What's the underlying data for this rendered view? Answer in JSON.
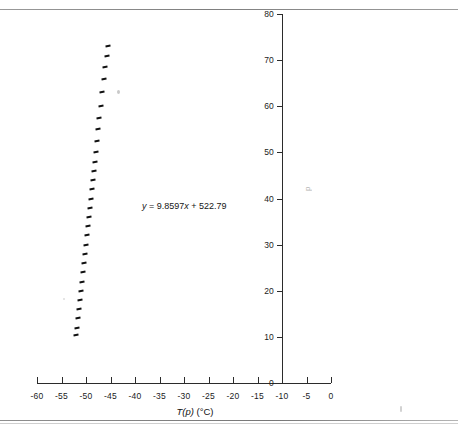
{
  "figure": {
    "equation_label": "y = 9.8597x + 522.79",
    "equation_slope": "9.8597",
    "equation_intercept": "522.79",
    "x_axis_title_main": "T(p)",
    "x_axis_title_units": "(°C)",
    "y_axis_title": "p"
  },
  "chart_data": {
    "type": "scatter",
    "title": "",
    "xlabel": "T(p) (°C)",
    "ylabel": "p",
    "xlim": [
      -60,
      0
    ],
    "ylim": [
      0,
      80
    ],
    "xticks": [
      -60,
      -55,
      -50,
      -45,
      -40,
      -35,
      -30,
      -25,
      -20,
      -15,
      -10,
      -5,
      0
    ],
    "xtick_labels": [
      "-60",
      "-55",
      "-50",
      "-45",
      "-40",
      "-35",
      "-30",
      "-25",
      "-20",
      "-15",
      "-10",
      "-5",
      "0"
    ],
    "yticks": [
      0,
      10,
      20,
      30,
      40,
      50,
      60,
      70,
      80
    ],
    "ytick_labels": [
      "0",
      "10",
      "20",
      "30",
      "40",
      "50",
      "60",
      "70",
      "80"
    ],
    "grid": false,
    "legend": false,
    "y_axis_position_x": -10,
    "annotations": [
      {
        "text": "y = 9.8597x + 522.79",
        "x": -38.5,
        "y": 39.5
      }
    ],
    "series": [
      {
        "name": "measurements",
        "marker": "dash",
        "color": "#101010",
        "x": [
          -51.95,
          -51.8,
          -51.6,
          -51.4,
          -51.2,
          -51.0,
          -50.8,
          -50.6,
          -50.4,
          -50.2,
          -50.0,
          -49.8,
          -49.6,
          -49.4,
          -49.2,
          -49.0,
          -48.8,
          -48.6,
          -48.4,
          -48.2,
          -48.0,
          -47.75,
          -47.5,
          -47.25,
          -47.0,
          -46.7,
          -46.4,
          -46.1,
          -45.8,
          -45.55
        ],
        "y": [
          10.5,
          12.0,
          14.0,
          16.0,
          18.0,
          20.0,
          22.0,
          24.0,
          26.0,
          28.0,
          30.0,
          32.0,
          34.0,
          36.0,
          38.0,
          40.0,
          42.0,
          44.0,
          46.0,
          48.0,
          50.0,
          52.5,
          55.0,
          57.5,
          60.0,
          63.0,
          66.0,
          68.5,
          71.0,
          73.0
        ]
      }
    ],
    "trendline": {
      "equation": "y = 9.8597x + 522.79",
      "slope": 9.8597,
      "intercept": 522.79,
      "x_start": -52.0,
      "x_end": -45.5,
      "color": "#101010"
    }
  }
}
